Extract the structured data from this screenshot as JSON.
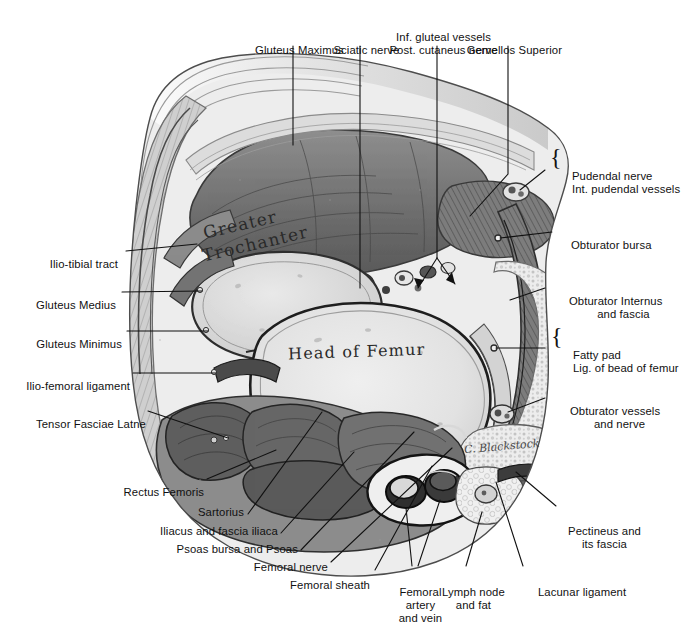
{
  "figure": {
    "signature": "C. Blackstock",
    "palette": {
      "background": "#ffffff",
      "ink": "#111111",
      "muscle_dark": "#5d5d5d",
      "muscle_mid": "#8a8a8a",
      "fascia_light": "#d7d7d7",
      "bone_light": "#ebebeb",
      "fat_pale": "#f2f2f2",
      "vessel_dark": "#3a3a3a"
    }
  },
  "inset_labels": [
    {
      "id": "greater-trochanter",
      "text": "Greater\nTrochanter"
    },
    {
      "id": "head-of-femur",
      "text": "Head of Femur"
    }
  ],
  "labels": {
    "gluteus_maximus": "Gluteus Maximus",
    "sciatic_nerve": "Sciatic nerve",
    "inf_gluteal_vessels": "Inf. gluteal vessels",
    "post_cutaneus_nerve": "Post. cutaneus nerve",
    "gemellos_superior": "Gemellos Superior",
    "pudendal_nerve": "Pudendal nerve",
    "int_pudendal_vessels": "Int. pudendal vessels",
    "obturator_bursa": "Obturator bursa",
    "obturator_internus": "Obturator Internus",
    "and_fascia": "and fascia",
    "fatty_pad": "Fatty pad",
    "lig_of_bead_of_femur": "Lig. of bead of femur",
    "obturator_vessels": "Obturator vessels",
    "and_nerve": "and nerve",
    "pectineus_and": "Pectineus and",
    "its_fascia": "its fascia",
    "lacunar_ligament": "Lacunar ligament",
    "lymph_node": "Lymph node",
    "and_fat": "and fat",
    "femoral_artery": "Femoral",
    "femoral_artery_2": "artery",
    "femoral_artery_3": "and vein",
    "femoral_sheath": "Femoral sheath",
    "femoral_nerve": "Femoral nerve",
    "psoas_bursa_and_psoas": "Psoas bursa and Psoas",
    "iliacus_and_fascia_iliaca": "Iliacus and fascia iliaca",
    "sartorius": "Sartorius",
    "rectus_femoris": "Rectus Femoris",
    "tensor_fasciae_latne": "Tensor Fasciae Latne",
    "ilio_femoral_ligament": "Ilio-femoral ligament",
    "gluteus_minimus": "Gluteus Minimus",
    "gluteus_medius": "Gluteus Medius",
    "ilio_tibial_tract": "Ilio-tibial tract"
  },
  "braces": {
    "pudendal": "{",
    "fatty": "{"
  }
}
